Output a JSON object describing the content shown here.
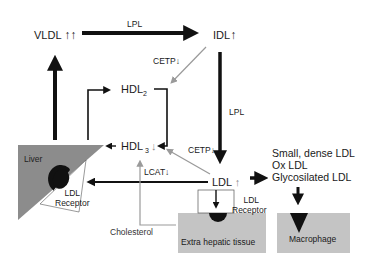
{
  "diagram": {
    "nodes": {
      "vldl": {
        "label": "VLDL",
        "indicator": "↑↑"
      },
      "idl": {
        "label": "IDL",
        "indicator": "↑"
      },
      "hdl2": {
        "label": "HDL",
        "subscript": "2"
      },
      "hdl3": {
        "label": "HDL",
        "subscript": "3",
        "indicator": "↓"
      },
      "ldl": {
        "label": "LDL",
        "indicator": "↑"
      },
      "liver": {
        "label": "Liver",
        "receptor_label_1": "LDL",
        "receptor_label_2": "Receptor"
      },
      "extra_hepatic": {
        "label": "Extra hepatic tissue",
        "receptor_label_1": "LDL",
        "receptor_label_2": "Receptor"
      },
      "macrophage": {
        "label": "Macrophage"
      },
      "modified_ldl": {
        "lines": [
          "Small, dense LDL",
          "Ox LDL",
          "Glycosilated LDL"
        ]
      },
      "cholesterol": {
        "label": "Cholesterol"
      }
    },
    "edge_labels": {
      "vldl_to_idl": "LPL",
      "idl_to_ldl": "LPL",
      "idl_to_hdl2_cetp": "CETP↓",
      "ldl_to_hdl3_cetp": "CETP↓",
      "lcat": "LCAT↓"
    },
    "colors": {
      "arrow_dark": "#111111",
      "arrow_grey": "#9a9a9a",
      "tissue_fill": "#c4c4c4",
      "liver_fill": "#8c8c8c",
      "receptor_dark": "#111111"
    }
  }
}
